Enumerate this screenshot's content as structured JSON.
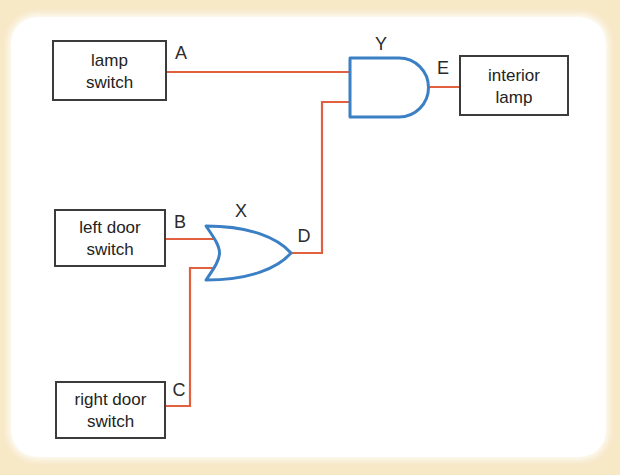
{
  "figure": {
    "background_color": "#f7e8c6",
    "panel_color": "#ffffff",
    "wire_color": "#e0603f",
    "gate_color": "#3b7fc4",
    "box_border_color": "#3b3b3b"
  },
  "blocks": [
    {
      "id": "lamp-switch",
      "line1": "lamp",
      "line2": "switch"
    },
    {
      "id": "left-door-switch",
      "line1": "left door",
      "line2": "switch"
    },
    {
      "id": "right-door-switch",
      "line1": "right door",
      "line2": "switch"
    },
    {
      "id": "interior-lamp",
      "line1": "interior",
      "line2": "lamp"
    }
  ],
  "gates": [
    {
      "id": "gate-x",
      "label": "X",
      "type": "or"
    },
    {
      "id": "gate-y",
      "label": "Y",
      "type": "and"
    }
  ],
  "signals": {
    "a": "A",
    "b": "B",
    "c": "C",
    "d": "D",
    "e": "E"
  }
}
